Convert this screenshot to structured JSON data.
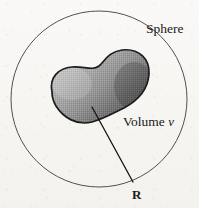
{
  "figure": {
    "type": "physics-diagram",
    "background_color": "#f8f7f5",
    "ink_color": "#1a1a1a",
    "labels": {
      "sphere": "Sphere",
      "volume_word": "Volume",
      "volume_symbol": "v",
      "radius": "R",
      "density": "ρ"
    },
    "shapes": {
      "sphere_outline": {
        "name": "sphere",
        "center_x": 99,
        "center_y": 99,
        "radius": 88,
        "stroke": "#3a3a3a",
        "stroke_width": 0.9,
        "fill": "none"
      },
      "volume_blob": {
        "name": "volume-v",
        "fill_light": "#b9b9b9",
        "fill_dark": "#4e4e4e",
        "stroke": "#1c1c1c",
        "stroke_width": 1.6,
        "path": "M 52 92 C 49 78 58 68 72 67 C 84 66 92 71 99 66 C 105 61 108 52 122 50 C 139 48 150 59 149 74 C 148 90 137 101 124 108 C 112 114 101 120 92 122 C 76 126 63 117 56 106 C 53 101 52 96 52 92 Z"
      },
      "radius_line": {
        "name": "radius-line",
        "x1": 92,
        "y1": 107,
        "x2": 133,
        "y2": 182,
        "stroke": "#141414",
        "stroke_width": 1.3
      }
    }
  }
}
